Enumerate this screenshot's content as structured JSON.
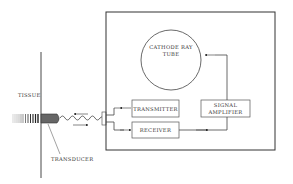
{
  "diagram": {
    "labels": {
      "tissue": "TISSUE",
      "transducer": "TRANSDUCER",
      "crt_line1": "CATHODE RAY",
      "crt_line2": "TUBE",
      "transmitter": "TRANSMITTER",
      "receiver": "RECEIVER",
      "amp_line1": "SIGNAL",
      "amp_line2": "AMPLIFIER"
    },
    "components": [
      "Tissue",
      "Transducer",
      "Transmitter",
      "Receiver",
      "Signal Amplifier",
      "Cathode Ray Tube"
    ],
    "connections": [
      {
        "from": "Transmitter",
        "to": "Transducer"
      },
      {
        "from": "Transducer",
        "to": "Receiver"
      },
      {
        "from": "Receiver",
        "to": "Signal Amplifier"
      },
      {
        "from": "Signal Amplifier",
        "to": "Cathode Ray Tube"
      }
    ]
  }
}
